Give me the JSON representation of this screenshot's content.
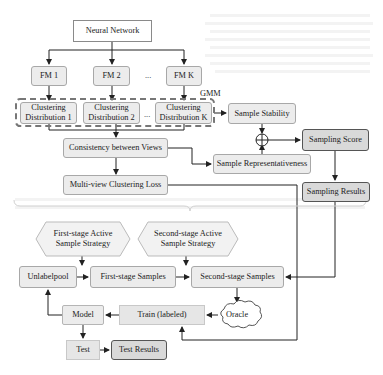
{
  "top_section": {
    "neural_network": "Neural Network",
    "feature_maps": [
      "FM 1",
      "FM 2",
      "FM K"
    ],
    "fm_ellipsis": "...",
    "gmm_label": "GMM",
    "clustering": [
      {
        "line1": "Clustering",
        "line2": "Distribution 1"
      },
      {
        "line1": "Clustering",
        "line2": "Distribution 2"
      },
      {
        "line1": "Clustering",
        "line2": "Distribution K"
      }
    ],
    "clustering_ellipsis": "...",
    "sample_stability": "Sample Stability",
    "consistency": "Consistency between Views",
    "sample_representativeness": "Sample Representativeness",
    "combine_symbol": "⊕",
    "sampling_score": "Sampling Score",
    "multi_view_loss": "Multi-view Clustering Loss",
    "sampling_results": "Sampling Results"
  },
  "bottom_section": {
    "first_strategy": {
      "line1": "First-stage Active",
      "line2": "Sample Strategy"
    },
    "second_strategy": {
      "line1": "Second-stage Active",
      "line2": "Sample Strategy"
    },
    "unlabelpool": "Unlabelpool",
    "first_samples": "First-stage Samples",
    "second_samples": "Second-stage Samples",
    "oracle": "Oracle",
    "train": "Train (labeled)",
    "model": "Model",
    "test": "Test",
    "test_results": "Test Results"
  },
  "colors": {
    "box_light": "#ececec",
    "box_dark": "#d9d9d9",
    "line": "#222222",
    "dash": "#777777"
  }
}
